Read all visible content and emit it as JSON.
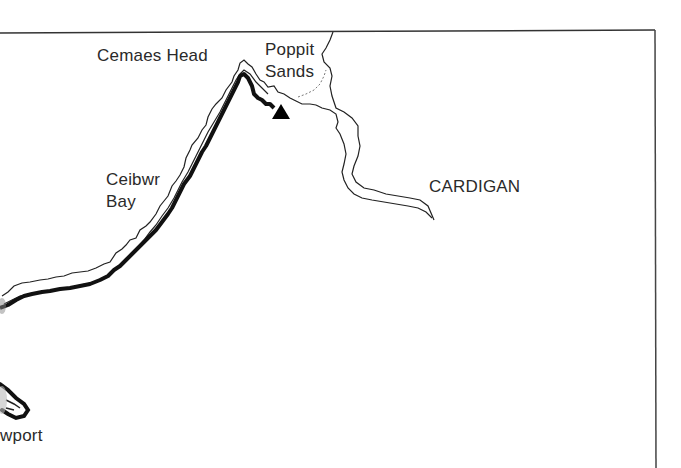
{
  "map": {
    "frame_color": "#333333",
    "route_color": "#111111",
    "coast_color": "#222222",
    "labels": {
      "cemaes_head": "Cemaes Head",
      "poppit_line1": "Poppit",
      "poppit_line2": "Sands",
      "ceibwr_line1": "Ceibwr",
      "ceibwr_line2": "Bay",
      "cardigan": "CARDIGAN",
      "newport_partial": "wport"
    },
    "markers": [
      {
        "name": "start-end-point",
        "symbol": "triangle",
        "label": ""
      }
    ]
  }
}
